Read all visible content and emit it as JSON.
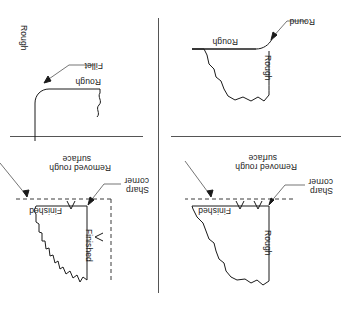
{
  "figure": {
    "orientation": "rotated-180",
    "background_color": "#ffffff",
    "line_color": "#1a1a1a",
    "panel_count": 4
  },
  "dividers": {
    "vertical": {
      "name": "vertical-divider"
    },
    "horizontal_left": {
      "name": "horizontal-divider-left"
    },
    "horizontal_right": {
      "name": "horizontal-divider-right"
    }
  },
  "panels": [
    {
      "id": "top-left",
      "labels": {
        "rough": "Rough",
        "finished": "Finished",
        "sharp_corner_line1": "Sharp",
        "sharp_corner_line2": "corner",
        "removed_rough_line1": "Removed rough",
        "removed_rough_line2": "surface"
      }
    },
    {
      "id": "top-right",
      "labels": {
        "finished_vertical": "Finished",
        "finished_horizontal": "Finished",
        "sharp_corner_line1": "Sharp",
        "sharp_corner_line2": "corner",
        "removed_rough_line1": "Removed rough",
        "removed_rough_line2": "surface"
      }
    },
    {
      "id": "bottom-left",
      "labels": {
        "rough_vertical": "Rough",
        "rough_horizontal": "Rough",
        "round": "Round"
      }
    },
    {
      "id": "bottom-right",
      "labels": {
        "rough_horizontal": "Rough",
        "rough_vertical": "Rough",
        "fillet": "Fillet"
      }
    }
  ]
}
